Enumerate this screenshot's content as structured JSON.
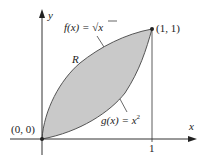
{
  "figure": {
    "region_label": "R",
    "upper_curve": {
      "label_lhs": "f(x) = ",
      "label_rhs": "x",
      "sqrt_symbol": "√"
    },
    "lower_curve": {
      "label_lhs": "g(x) = x",
      "sup": "2"
    },
    "points": [
      {
        "label": "(0, 0)"
      },
      {
        "label": "(1, 1)"
      }
    ],
    "axes": {
      "x_label": "x",
      "y_label": "y",
      "x_tick": "1"
    },
    "colors": {
      "fill": "#c8c8c8",
      "curve": "#555555",
      "axis": "#333333"
    }
  }
}
